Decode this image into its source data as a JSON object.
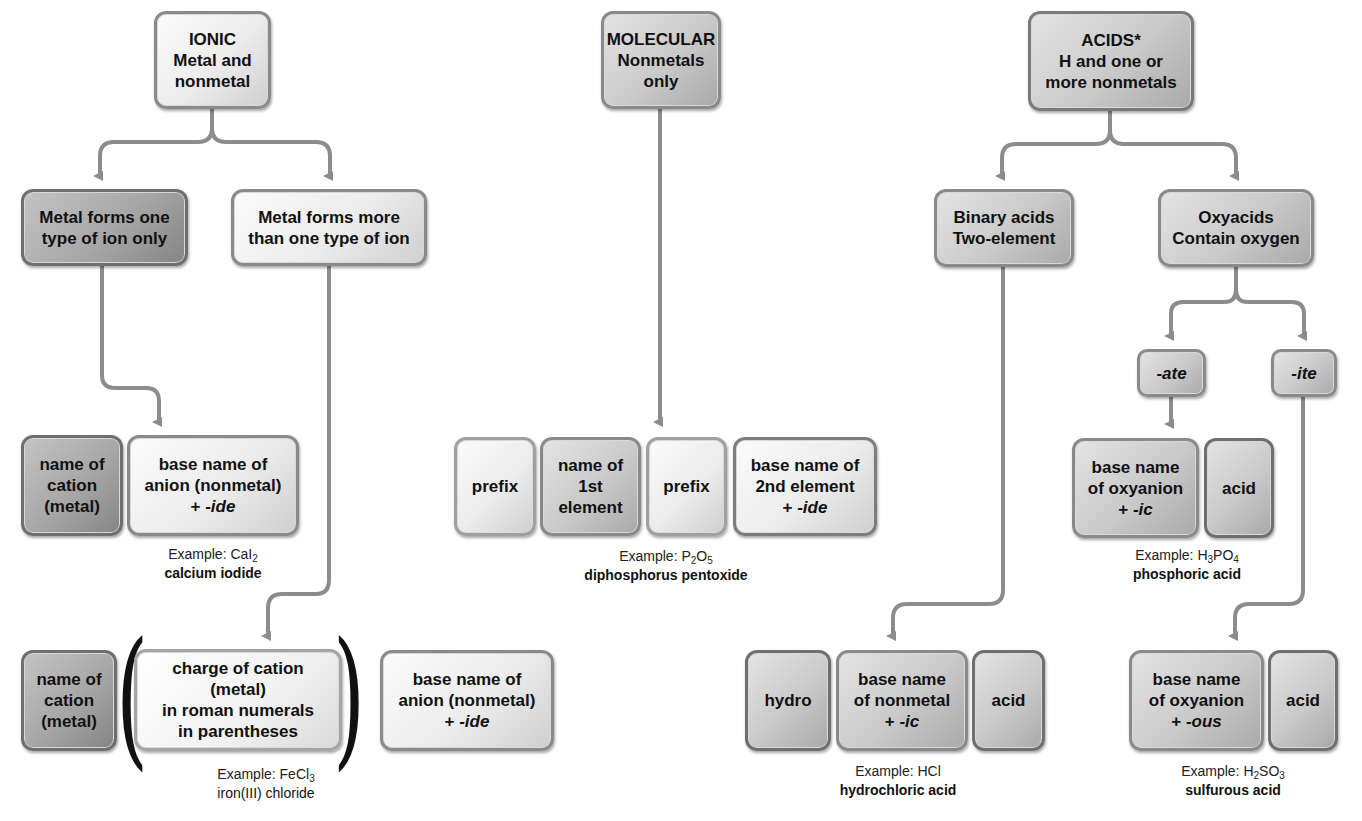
{
  "diagram": {
    "colors": {
      "connector": "#8c8c8c",
      "box_border": "#8a8a8a",
      "box_light": "#ececec",
      "box_dark": "#a6a6a6"
    },
    "ionic": {
      "root": {
        "line1": "IONIC",
        "line2": "Metal and",
        "line3": "nonmetal"
      },
      "branch_one": {
        "line1": "Metal forms one",
        "line2": "type of ion only"
      },
      "branch_more": {
        "line1": "Metal forms more",
        "line2": "than one type of ion"
      },
      "formula_one": {
        "cation": {
          "line1": "name of",
          "line2": "cation",
          "line3": "(metal)"
        },
        "anion": {
          "line1": "base name of",
          "line2": "anion (nonmetal)",
          "line3_prefix": "+ ",
          "line3_suffix": "-ide"
        },
        "example": {
          "label": "Example: ",
          "formula_parts": [
            "CaI",
            "2"
          ],
          "name": "calcium iodide"
        }
      },
      "formula_more": {
        "cation": {
          "line1": "name of",
          "line2": "cation",
          "line3": "(metal)"
        },
        "open_paren": "(",
        "charge": {
          "line1": "charge of cation (metal)",
          "line2": "in roman numerals",
          "line3": "in parentheses"
        },
        "close_paren": ")",
        "anion": {
          "line1": "base name of",
          "line2": "anion (nonmetal)",
          "line3_prefix": "+ ",
          "line3_suffix": "-ide"
        },
        "example": {
          "label": "Example: ",
          "formula_parts": [
            "FeCl",
            "3"
          ],
          "name": "iron(III) chloride"
        }
      }
    },
    "molecular": {
      "root": {
        "line1": "MOLECULAR",
        "line2": "Nonmetals",
        "line3": "only"
      },
      "formula": {
        "prefix1": "prefix",
        "first": {
          "line1": "name of",
          "line2": "1st",
          "line3": "element"
        },
        "prefix2": "prefix",
        "second": {
          "line1": "base name of",
          "line2": "2nd element",
          "line3_prefix": "+ ",
          "line3_suffix": "-ide"
        },
        "example": {
          "label": "Example: ",
          "formula_parts": [
            "P",
            "2",
            "O",
            "5"
          ],
          "name": "diphosphorus pentoxide"
        }
      }
    },
    "acids": {
      "root": {
        "line1": "ACIDS*",
        "line2": "H and one or",
        "line3": "more nonmetals"
      },
      "binary": {
        "line1": "Binary acids",
        "line2": "Two-element"
      },
      "oxy": {
        "line1": "Oxyacids",
        "line2": "Contain oxygen"
      },
      "ate": "-ate",
      "ite": "-ite",
      "binary_formula": {
        "hydro": "hydro",
        "base": {
          "line1": "base name",
          "line2": "of nonmetal",
          "line3_prefix": "+ ",
          "line3_suffix": "-ic"
        },
        "acid": "acid",
        "example": {
          "label": "Example: ",
          "formula_parts": [
            "HCl"
          ],
          "name": "hydrochloric acid"
        }
      },
      "ate_formula": {
        "base": {
          "line1": "base name",
          "line2": "of oxyanion",
          "line3_prefix": "+ ",
          "line3_suffix": "-ic"
        },
        "acid": "acid",
        "example": {
          "label": "Example: ",
          "formula_parts": [
            "H",
            "3",
            "PO",
            "4"
          ],
          "name": "phosphoric acid"
        }
      },
      "ite_formula": {
        "base": {
          "line1": "base name",
          "line2": "of oxyanion",
          "line3_prefix": "+ ",
          "line3_suffix": "-ous"
        },
        "acid": "acid",
        "example": {
          "label": "Example: ",
          "formula_parts": [
            "H",
            "2",
            "SO",
            "3"
          ],
          "name": "sulfurous acid"
        }
      }
    }
  }
}
